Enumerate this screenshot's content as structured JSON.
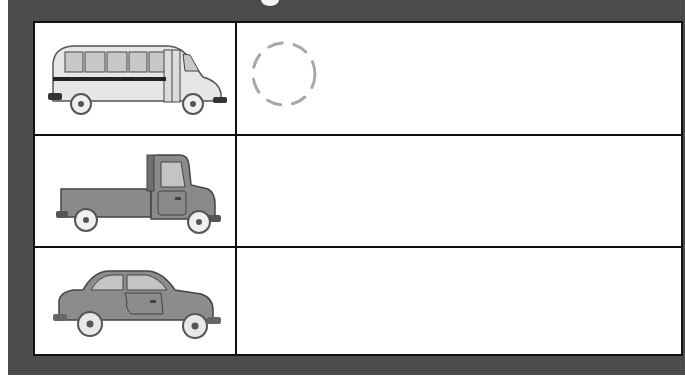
{
  "worksheet": {
    "title_fragment": "",
    "frame_color": "#4a4a4a",
    "rows": [
      {
        "vehicle": "bus",
        "image_label": "school bus",
        "color": "#e3e3e3",
        "answer": "",
        "has_trace_circle": true
      },
      {
        "vehicle": "truck",
        "image_label": "pickup truck",
        "color": "#8a8a8a",
        "answer": ""
      },
      {
        "vehicle": "car",
        "image_label": "sedan car",
        "color": "#8c8c8c",
        "answer": ""
      }
    ],
    "trace_circle": {
      "stroke": "#a8a8a8",
      "style": "dashed"
    }
  }
}
